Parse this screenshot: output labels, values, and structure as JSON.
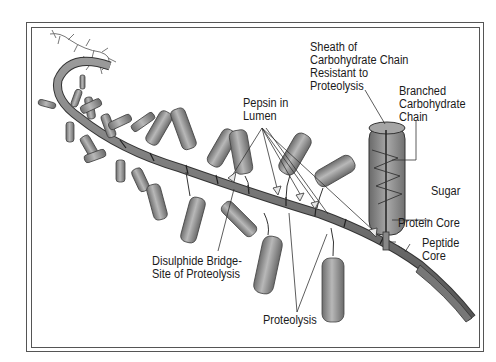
{
  "diagram": {
    "type": "mucin glycoprotein structure",
    "labels": {
      "sheath": [
        "Sheath of",
        "Carbohydrate Chain",
        "Resistant to",
        "Proteolysis"
      ],
      "branched": [
        "Branched",
        "Carbohydrate",
        "Chain"
      ],
      "pepsin": [
        "Pepsin in",
        "Lumen"
      ],
      "sugar": "Sugar",
      "protein_core": "Protein Core",
      "peptide_core": [
        "Peptide",
        "Core"
      ],
      "disulphide": [
        "Disulphide Bridge-",
        "Site of Proteolysis"
      ],
      "proteolysis": "Proteolysis"
    },
    "colors": {
      "cylinder_fill": "#8a8a8a",
      "cylinder_light": "#b5b5b5",
      "core_fill": "#7a7a7a",
      "line": "#333333",
      "border": "#555555"
    }
  }
}
